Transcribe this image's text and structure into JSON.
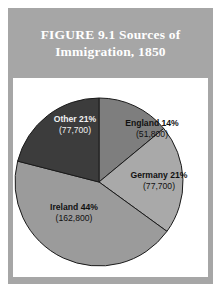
{
  "figure": {
    "title": "FIGURE 9.1   Sources of\nImmigration, 1850",
    "panel_color": "#a6a6a6",
    "title_color": "#ffffff",
    "plate_color": "#ffffff"
  },
  "chart_data": {
    "type": "pie",
    "title": "FIGURE 9.1   Sources of Immigration, 1850",
    "xlabel": "",
    "ylabel": "",
    "legend": "none (labels drawn on slices)",
    "grid": false,
    "start_angle_deg": 0,
    "direction": "clockwise",
    "total": 370000,
    "categories": [
      "England",
      "Germany",
      "Ireland",
      "Other"
    ],
    "values": [
      14,
      21,
      44,
      21
    ],
    "counts": [
      51800,
      77700,
      162800,
      77700
    ],
    "count_labels": [
      "(51,800)",
      "(77,700)",
      "(162,800)",
      "(77,700)"
    ],
    "percent_labels": [
      "England 14%",
      "Germany 21%",
      "Ireland 44%",
      "Other 21%"
    ],
    "colors": [
      "#7e7e7e",
      "#a9a9a9",
      "#9b9b9b",
      "#3c3c3c"
    ],
    "slices": [
      {
        "name": "England",
        "label_line1": "England 14%",
        "label_line2": "(51,800)",
        "percent": 14,
        "count": 51800,
        "color": "#7e7e7e",
        "label_on_dark": false
      },
      {
        "name": "Germany",
        "label_line1": "Germany 21%",
        "label_line2": "(77,700)",
        "percent": 21,
        "count": 77700,
        "color": "#a9a9a9",
        "label_on_dark": false
      },
      {
        "name": "Ireland",
        "label_line1": "Ireland 44%",
        "label_line2": "(162,800)",
        "percent": 44,
        "count": 162800,
        "color": "#9b9b9b",
        "label_on_dark": false
      },
      {
        "name": "Other",
        "label_line1": "Other 21%",
        "label_line2": "(77,700)",
        "percent": 21,
        "count": 77700,
        "color": "#3c3c3c",
        "label_on_dark": true
      }
    ]
  }
}
